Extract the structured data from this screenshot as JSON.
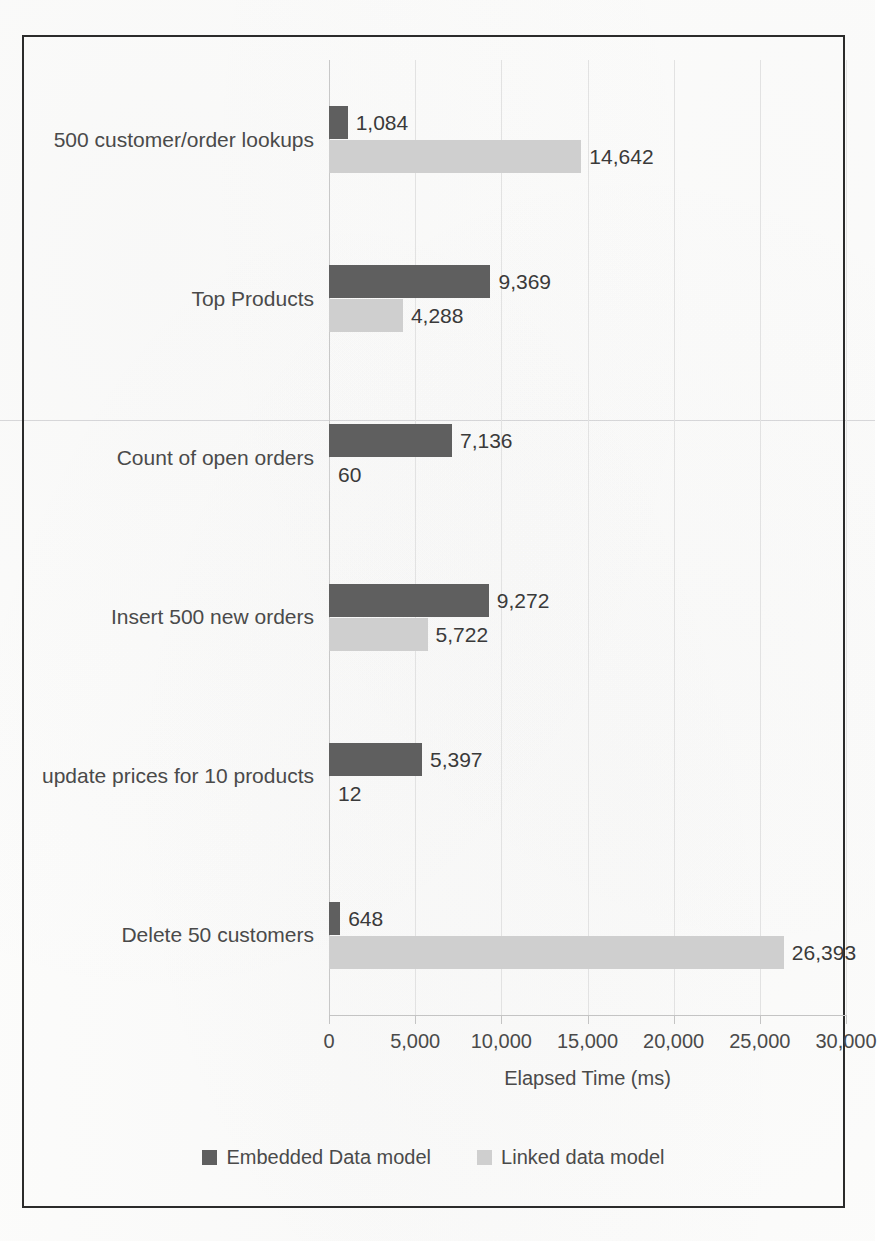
{
  "chart_data": {
    "type": "bar",
    "orientation": "horizontal",
    "title": "",
    "xlabel": "Elapsed Time (ms)",
    "ylabel": "",
    "xlim": [
      0,
      30000
    ],
    "xticks": [
      0,
      5000,
      10000,
      15000,
      20000,
      25000,
      30000
    ],
    "xtick_labels": [
      "0",
      "5,000",
      "10,000",
      "15,000",
      "20,000",
      "25,000",
      "30,000"
    ],
    "grid": true,
    "legend_position": "bottom",
    "categories": [
      "500 customer/order lookups",
      "Top Products",
      "Count of open orders",
      "Insert 500 new orders",
      "update prices for 10 products",
      "Delete 50 customers"
    ],
    "series": [
      {
        "name": "Embedded Data model",
        "color": "#5f5f5f",
        "values": [
          1084,
          9369,
          7136,
          9272,
          5397,
          648
        ],
        "value_labels": [
          "1,084",
          "9,369",
          "7,136",
          "9,272",
          "5,397",
          "648"
        ]
      },
      {
        "name": "Linked data model",
        "color": "#cfcfcf",
        "values": [
          14642,
          4288,
          60,
          5722,
          12,
          26393
        ],
        "value_labels": [
          "14,642",
          "4,288",
          "60",
          "5,722",
          "12",
          "26,393"
        ]
      }
    ]
  },
  "legend": {
    "items": [
      {
        "label": "Embedded Data model",
        "color": "#5f5f5f"
      },
      {
        "label": "Linked data model",
        "color": "#cfcfcf"
      }
    ]
  },
  "axis": {
    "x_title": "Elapsed Time (ms)"
  }
}
